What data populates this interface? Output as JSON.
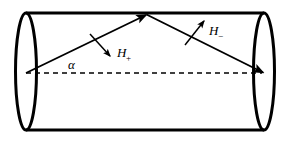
{
  "figure": {
    "type": "geometric-diagram",
    "colors": {
      "stroke": "#000000",
      "background": "#ffffff",
      "fill": "#ffffff"
    },
    "labels": {
      "alpha": "α",
      "h_plus_symbol": "H",
      "h_plus_subscript": "+",
      "h_minus_symbol": "H",
      "h_minus_subscript": "−"
    },
    "shapes": {
      "cylinder": {
        "name": "cylinder-body",
        "left_ellipse": {
          "cx": 26,
          "cy": 71.5,
          "rx": 10.5,
          "ry": 58.5
        },
        "right_ellipse": {
          "cx": 264,
          "cy": 71.5,
          "rx": 10.5,
          "ry": 58.5
        },
        "top_line": {
          "x1": 26,
          "y1": 13,
          "x2": 264,
          "y2": 13
        },
        "bottom_line": {
          "x1": 26,
          "y1": 130,
          "x2": 264,
          "y2": 130
        }
      },
      "axis": {
        "name": "cylinder-axis",
        "style": "dashed",
        "x1": 26,
        "y1": 73,
        "x2": 264,
        "y2": 73
      },
      "ray_up": {
        "name": "incident-ray",
        "x1": 26,
        "y1": 73,
        "x2": 146,
        "y2": 14,
        "arrow": "end"
      },
      "ray_down": {
        "name": "reflected-ray",
        "x1": 146,
        "y1": 14,
        "x2": 264,
        "y2": 73,
        "arrow": "end"
      },
      "vector_h_plus": {
        "name": "h-plus-vector",
        "x1": 91,
        "y1": 35,
        "x2": 111,
        "y2": 57,
        "arrow": "end"
      },
      "vector_h_minus": {
        "name": "h-minus-vector",
        "x1": 186,
        "y1": 44,
        "x2": 204,
        "y2": 21,
        "arrow": "end"
      },
      "angle_arc": {
        "name": "alpha-angle-arc",
        "cx": 26,
        "cy": 73,
        "r": 46
      }
    },
    "label_positions": {
      "alpha": {
        "x": 68,
        "y": 68
      },
      "h_plus": {
        "x": 116,
        "y": 58
      },
      "h_minus": {
        "x": 208,
        "y": 35
      }
    }
  }
}
